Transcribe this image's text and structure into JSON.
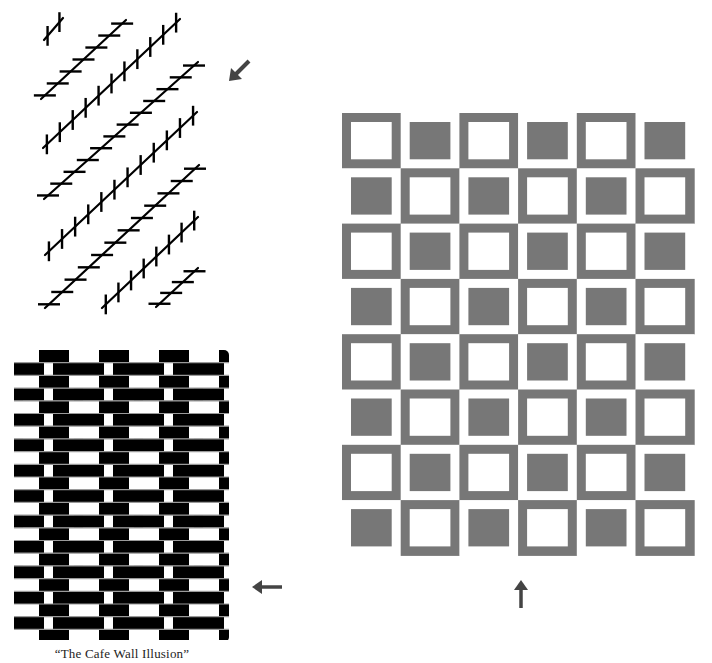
{
  "caption": "“The Cafe Wall Illusion”",
  "colors": {
    "ink": "#000000",
    "gray": "#777777",
    "mortar": "#9a9a9a",
    "arrow": "#444444",
    "background": "#ffffff"
  },
  "zollner": {
    "name": "Zollner illusion",
    "tick_length": 22,
    "tick_spacing": 14,
    "lines": [
      {
        "x1": 44,
        "y1": 40,
        "x2": 63,
        "y2": 18,
        "ticks": "vertical"
      },
      {
        "x1": 41,
        "y1": 99,
        "x2": 126,
        "y2": 20,
        "ticks": "horizontal"
      },
      {
        "x1": 43,
        "y1": 148,
        "x2": 180,
        "y2": 19,
        "ticks": "vertical"
      },
      {
        "x1": 44,
        "y1": 199,
        "x2": 198,
        "y2": 62,
        "ticks": "horizontal"
      },
      {
        "x1": 45,
        "y1": 255,
        "x2": 197,
        "y2": 112,
        "ticks": "vertical"
      },
      {
        "x1": 45,
        "y1": 308,
        "x2": 199,
        "y2": 165,
        "ticks": "horizontal"
      },
      {
        "x1": 102,
        "y1": 308,
        "x2": 198,
        "y2": 217,
        "ticks": "vertical"
      },
      {
        "x1": 156,
        "y1": 307,
        "x2": 198,
        "y2": 268,
        "ticks": "horizontal"
      }
    ]
  },
  "cafe_wall": {
    "name": "Cafe wall illusion",
    "left": 14,
    "right": 229,
    "top": 350,
    "rows": 23,
    "row_height": 12.7,
    "tile_width": 30,
    "row_offsets": [
      25,
      0
    ],
    "first_row_starts_black_at": 39
  },
  "checker_grid": {
    "name": "Checkered squares illusion",
    "left": 342,
    "top": 113,
    "cols": 6,
    "rows": 8,
    "cell_width": 58.7,
    "cell_height": 55.3,
    "inset": 9
  },
  "arrows": [
    {
      "id": "zollner-arrow",
      "direction": "down-left",
      "x": 232,
      "y": 60
    },
    {
      "id": "cafe-arrow",
      "direction": "left",
      "x": 252,
      "y": 587
    },
    {
      "id": "grid-arrow",
      "direction": "up",
      "x": 521,
      "y": 594
    }
  ]
}
